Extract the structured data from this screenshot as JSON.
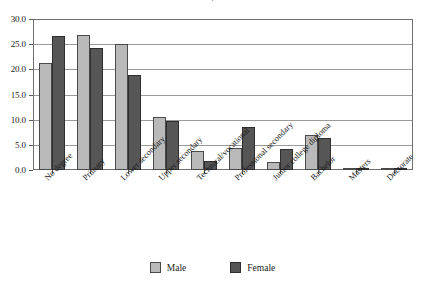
{
  "chart_data": {
    "type": "bar",
    "title": "",
    "xlabel": "",
    "ylabel": "",
    "ylim": [
      0.0,
      30.0
    ],
    "ytick_step": 5.0,
    "ytick_labels": [
      "30.0",
      "25.0",
      "20.0",
      "15.0",
      "10.0",
      "5.0",
      "0.0"
    ],
    "ytick_values": [
      30.0,
      25.0,
      20.0,
      15.0,
      10.0,
      5.0,
      0.0
    ],
    "grid": true,
    "grid_axis": "y",
    "legend_position": "bottom",
    "categories": [
      "No degree",
      "Primary",
      "Lower secondary",
      "Upper secondary",
      "Technical/vocational",
      "Professional secondary",
      "Junior college diploma",
      "Bachelor",
      "Masters",
      "Doctorate"
    ],
    "series": [
      {
        "name": "Male",
        "color": "#b9b9b9",
        "values": [
          21.3,
          26.9,
          25.0,
          10.6,
          3.7,
          4.4,
          1.5,
          7.0,
          0.2,
          0.2
        ]
      },
      {
        "name": "Female",
        "color": "#565656",
        "values": [
          26.7,
          24.2,
          18.8,
          9.8,
          1.8,
          8.5,
          4.1,
          6.3,
          0.2,
          0.1
        ]
      }
    ]
  },
  "figure": {
    "title_fragment": "y"
  },
  "legend": {
    "entries": [
      {
        "label": "Male"
      },
      {
        "label": "Female"
      }
    ]
  },
  "colors": {
    "male_fill": "#b9b9b9",
    "female_fill": "#565656",
    "axis": "#6f6f6f",
    "gridline": "#9a9a9a",
    "text": "#1a1a1a"
  }
}
